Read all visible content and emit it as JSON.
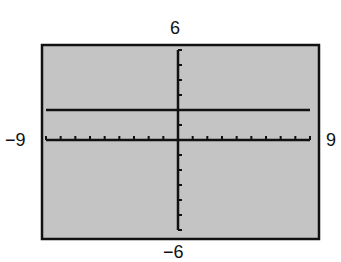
{
  "window": {
    "xmin_label": "−9",
    "xmax_label": "9",
    "ymin_label": "−6",
    "ymax_label": "6"
  },
  "colors": {
    "screen_bg": "#c4c4c4",
    "frame": "#111111",
    "axis": "#111111",
    "graph_line": "#111111",
    "page_bg": "#ffffff"
  },
  "chart_data": {
    "type": "line",
    "title": "",
    "xlabel": "",
    "ylabel": "",
    "xlim": [
      -9,
      9
    ],
    "ylim": [
      -6,
      6
    ],
    "xscale": 1,
    "yscale": 1,
    "grid": false,
    "legend": null,
    "tick_labels": {
      "xmin": "-9",
      "xmax": "9",
      "ymin": "-6",
      "ymax": "6"
    },
    "series": [
      {
        "name": "y = 2",
        "equation": "y = 2",
        "x": [
          -9,
          9
        ],
        "y": [
          2,
          2
        ]
      }
    ]
  }
}
